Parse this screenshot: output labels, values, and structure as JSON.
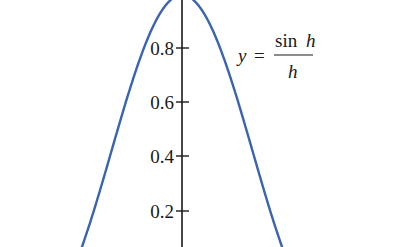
{
  "chart_data": {
    "type": "line",
    "title": "",
    "xlabel": "",
    "ylabel": "",
    "series": [
      {
        "name": "y = sin h / h",
        "function": "sin(h)/h",
        "color": "#3a64b0",
        "x": [
          -2.94,
          -2.5,
          -2.0,
          -1.5,
          -1.1,
          -0.8,
          -0.5,
          -0.25,
          0,
          0.25,
          0.5,
          0.8,
          1.1,
          1.5,
          2.0,
          2.5,
          2.94
        ],
        "values": [
          0.068,
          0.239,
          0.455,
          0.665,
          0.81,
          0.897,
          0.959,
          0.99,
          1.0,
          0.99,
          0.959,
          0.897,
          0.81,
          0.665,
          0.455,
          0.239,
          0.068
        ]
      }
    ],
    "yticks": [
      0.2,
      0.4,
      0.6,
      0.8
    ],
    "ytick_labels": [
      "0.2",
      "0.4",
      "0.6",
      "0.8"
    ],
    "ylim": [
      0.065,
      1.02
    ],
    "xlim": [
      -5.35,
      6.4
    ],
    "grid": false,
    "legend": "none",
    "annotations": [
      {
        "text": "y = sin h / h",
        "lhs": "y",
        "equals": "=",
        "numerator": "sin h",
        "denominator": "h"
      }
    ]
  },
  "axis": {
    "tick_labels": [
      "0.8",
      "0.6",
      "0.4",
      "0.2"
    ]
  },
  "equation": {
    "lhs": "y",
    "equals": "=",
    "numerator_fn": "sin",
    "numerator_var": "h",
    "denominator": "h"
  },
  "colors": {
    "curve": "#3a64b0",
    "axis": "#1a1a1a"
  }
}
